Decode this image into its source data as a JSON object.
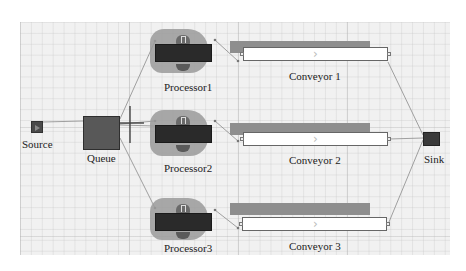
{
  "diagram": {
    "type": "discrete-event simulation model",
    "nodes": {
      "source": {
        "label": "Source",
        "icon": "source-block-icon"
      },
      "queue": {
        "label": "Queue",
        "icon": "queue-block-icon"
      },
      "processors": [
        {
          "label": "Processor1",
          "icon": "processor-machine-icon"
        },
        {
          "label": "Processor2",
          "icon": "processor-machine-icon"
        },
        {
          "label": "Processor3",
          "icon": "processor-machine-icon"
        }
      ],
      "conveyors": [
        {
          "label": "Conveyor 1",
          "icon": "conveyor-belt-icon",
          "direction_glyph": "›"
        },
        {
          "label": "Conveyor 2",
          "icon": "conveyor-belt-icon",
          "direction_glyph": "›"
        },
        {
          "label": "Conveyor 3",
          "icon": "conveyor-belt-icon",
          "direction_glyph": "›"
        }
      ],
      "sink": {
        "label": "Sink",
        "icon": "sink-block-icon"
      }
    },
    "connections": [
      [
        "Source",
        "Queue"
      ],
      [
        "Queue",
        "Processor1"
      ],
      [
        "Queue",
        "Processor2"
      ],
      [
        "Queue",
        "Processor3"
      ],
      [
        "Processor1",
        "Conveyor 1"
      ],
      [
        "Processor2",
        "Conveyor 2"
      ],
      [
        "Processor3",
        "Conveyor 3"
      ],
      [
        "Conveyor 1",
        "Sink"
      ],
      [
        "Conveyor 2",
        "Sink"
      ],
      [
        "Conveyor 3",
        "Sink"
      ]
    ],
    "colors": {
      "canvas": "#f1f1f1",
      "block_dark": "#2a2a2a",
      "shadow": "#9a9a9a",
      "belt": "#ffffff",
      "link": "#888888"
    }
  }
}
